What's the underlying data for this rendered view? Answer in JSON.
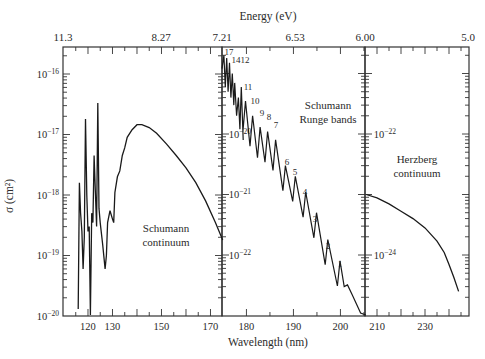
{
  "chart_data": {
    "type": "line",
    "title": "",
    "xlabel": "Wavelength (nm)",
    "ylabel": "σ (cm²)",
    "top_axis_label": "Energy (eV)",
    "top_axis_ticks": [
      "11.3",
      "8.27",
      "7.21",
      "6.53",
      "6.00",
      "5.0"
    ],
    "grid": false,
    "panels": [
      {
        "name": "Schumann continuum",
        "label_lines": [
          "Schumann",
          "continuum"
        ],
        "x_range_nm": [
          110,
          175
        ],
        "x_ticks": [
          "120",
          "130",
          "150",
          "170"
        ],
        "y_scale": "log",
        "y_range": [
          1e-20,
          3e-16
        ],
        "y_ticks": [
          "10⁻¹⁶",
          "10⁻¹⁷",
          "10⁻¹⁸",
          "10⁻¹⁹",
          "10⁻²⁰"
        ],
        "series": [
          {
            "name": "Schumann continuum / lines",
            "x": [
              116,
              116.5,
              117,
              117.5,
              118,
              118.5,
              119,
              119.5,
              120,
              120.5,
              121,
              121.5,
              122,
              122.5,
              123,
              123.5,
              124,
              124.5,
              125,
              126,
              127,
              127.5,
              128,
              129,
              130,
              130.5,
              131,
              132,
              133,
              134,
              135,
              136,
              138,
              140,
              142,
              145,
              148,
              152,
              156,
              160,
              164,
              168,
              172,
              175
            ],
            "y": [
              1.3e-20,
              1.6e-18,
              5e-19,
              2.5e-19,
              6e-20,
              2e-19,
              1.8e-17,
              1e-18,
              2.5e-19,
              3e-19,
              1e-20,
              5e-19,
              3.5e-19,
              4.5e-18,
              1.2e-18,
              3e-19,
              3.3e-17,
              6e-19,
              3.5e-19,
              1.5e-19,
              6e-20,
              1e-19,
              3.5e-19,
              5.5e-19,
              4e-19,
              3.5e-19,
              1.1e-18,
              2e-18,
              2.5e-18,
              4.5e-18,
              6e-18,
              9e-18,
              1.2e-17,
              1.45e-17,
              1.45e-17,
              1.3e-17,
              1.05e-17,
              7e-18,
              4.5e-18,
              2.8e-18,
              1.6e-18,
              8e-19,
              3.5e-19,
              1.8e-19
            ]
          }
        ]
      },
      {
        "name": "Schumann Runge bands",
        "label_lines": [
          "Schumann",
          "Runge bands"
        ],
        "x_range_nm": [
          175,
          205.5
        ],
        "x_ticks": [
          "180",
          "190",
          "200"
        ],
        "y_scale": "log",
        "y_ticks": [
          "10⁻²⁰",
          "10⁻²¹",
          "10⁻²²"
        ],
        "band_labels": [
          "17",
          "14",
          "12",
          "11",
          "10",
          "9",
          "8",
          "7",
          "6",
          "5",
          "4",
          "3",
          "2",
          "1"
        ],
        "band_peaks": [
          {
            "v": 17,
            "nm": 176.0,
            "sigma": 1.5e-19
          },
          {
            "v": 14,
            "nm": 177.4,
            "sigma": 7e-20
          },
          {
            "v": 12,
            "nm": 178.9,
            "sigma": 6e-20
          },
          {
            "v": 11,
            "nm": 179.8,
            "sigma": 3.5e-20
          },
          {
            "v": 10,
            "nm": 181.3,
            "sigma": 2e-20
          },
          {
            "v": 9,
            "nm": 182.9,
            "sigma": 1.3e-20
          },
          {
            "v": 8,
            "nm": 184.5,
            "sigma": 1.1e-20
          },
          {
            "v": 7,
            "nm": 186.2,
            "sigma": 8e-21
          },
          {
            "v": 6,
            "nm": 188.3,
            "sigma": 3e-21
          },
          {
            "v": 5,
            "nm": 190.4,
            "sigma": 2e-21
          },
          {
            "v": 4,
            "nm": 192.6,
            "sigma": 1.1e-21
          },
          {
            "v": 3,
            "nm": 194.9,
            "sigma": 5e-22
          },
          {
            "v": 2,
            "nm": 197.3,
            "sigma": 1.8e-22
          },
          {
            "v": 1,
            "nm": 199.9,
            "sigma": 8e-23
          }
        ]
      },
      {
        "name": "Herzberg continuum",
        "label_lines": [
          "Herzberg",
          "continuum"
        ],
        "x_range_nm": [
          205.5,
          249
        ],
        "x_ticks": [
          "210",
          "230"
        ],
        "y_scale": "log",
        "y_ticks": [
          "10⁻²²",
          "10⁻²⁴"
        ],
        "series": [
          {
            "name": "Herzberg continuum",
            "x": [
              205.5,
              210,
              215,
              220,
              225,
              230,
              235,
              238,
              240,
              242,
              244
            ],
            "y": [
              1e-23,
              8.8e-24,
              7e-24,
              5.3e-24,
              4e-24,
              2.8e-24,
              1.7e-24,
              1.1e-24,
              7e-25,
              4.3e-25,
              2.5e-25
            ]
          }
        ]
      }
    ]
  }
}
